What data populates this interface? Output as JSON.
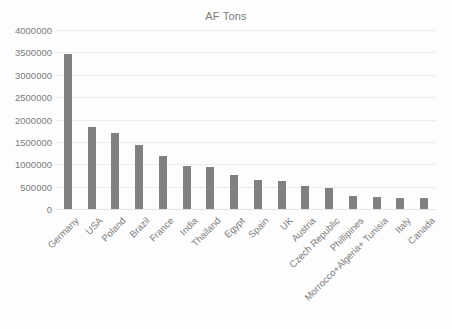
{
  "chart_data": {
    "type": "bar",
    "title": "AF Tons",
    "xlabel": "",
    "ylabel": "",
    "ylim": [
      0,
      4000000
    ],
    "grid": true,
    "legend": "none",
    "orientation": "vertical",
    "y_ticks": [
      "4000000",
      "3500000",
      "3000000",
      "2500000",
      "2000000",
      "1500000",
      "1000000",
      "500000",
      "0"
    ],
    "y_tick_values": [
      4000000,
      3500000,
      3000000,
      2500000,
      2000000,
      1500000,
      1000000,
      500000,
      0
    ],
    "categories": [
      "Germany",
      "USA",
      "Poland",
      "Brazil",
      "France",
      "India",
      "Thailand",
      "Egypt",
      "Spain",
      "UK",
      "Austria",
      "Czech Republic",
      "Phillipines",
      "Morrocco+Algeria+ Tunisia",
      "Italy",
      "Canada"
    ],
    "values": [
      3470000,
      1830000,
      1700000,
      1430000,
      1180000,
      960000,
      940000,
      760000,
      650000,
      630000,
      520000,
      470000,
      280000,
      265000,
      250000,
      245000
    ],
    "bar_color": "#808080",
    "gridline_color": "#ececec",
    "text_color": "#7c7c7c",
    "background_color": "#fdfdfd"
  }
}
